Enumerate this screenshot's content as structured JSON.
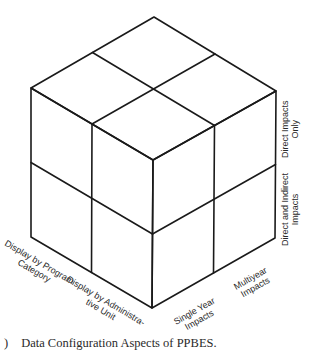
{
  "figure": {
    "type": "isometric-cube-diagram",
    "caption_number_fragment": ")",
    "caption": "Data Configuration Aspects of PPBES.",
    "axes": {
      "left_face_bottom": {
        "description": "Display dimension (left-front edge)",
        "labels": [
          {
            "line1": "Display by Program",
            "line2": "Category"
          },
          {
            "line1": "Display by Administra-",
            "line2": "tive Unit"
          }
        ]
      },
      "right_face_bottom": {
        "description": "Time dimension (right-front edge)",
        "labels": [
          {
            "line1": "Single Year",
            "line2": "Impacts"
          },
          {
            "line1": "Multiyear",
            "line2": "Impacts"
          }
        ]
      },
      "right_side_vertical": {
        "description": "Impact dimension (right vertical edge)",
        "labels": [
          {
            "line1": "Direct Impacts",
            "line2": "Only"
          },
          {
            "line1": "Direct and Indirect",
            "line2": "Impacts"
          }
        ]
      }
    },
    "grid": "2x2x2",
    "colors": {
      "line": "#1a1a1a",
      "text": "#2a2a2a",
      "background": "#ffffff"
    }
  }
}
